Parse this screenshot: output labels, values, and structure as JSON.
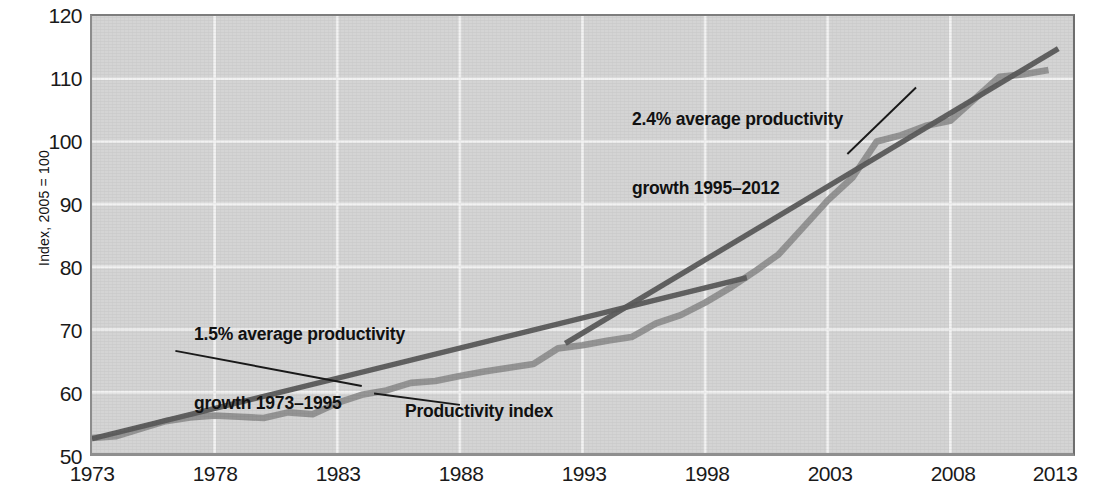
{
  "colors": {
    "plot_background": "#d4d4d4",
    "gridline": "#f2f2f2",
    "series_line": "#8d8d8d",
    "trend_line": "#5b5b5b",
    "text": "#111111"
  },
  "axes": {
    "y_title": "Index, 2005 = 100",
    "y_ticks": [
      "120",
      "110",
      "100",
      "90",
      "80",
      "70",
      "60",
      "50"
    ],
    "x_ticks": [
      "1973",
      "1978",
      "1983",
      "1988",
      "1993",
      "1998",
      "2003",
      "2008",
      "2013"
    ]
  },
  "annotations": {
    "trend1_line1": "1.5% average productivity",
    "trend1_line2": "growth 1973–1995",
    "trend2_line1": "2.4% average productivity",
    "trend2_line2": "growth 1995–2012",
    "series_label": "Productivity index"
  },
  "chart_data": {
    "type": "line",
    "title": "",
    "xlabel": "",
    "ylabel": "Index, 2005 = 100",
    "xlim": [
      1973,
      2013
    ],
    "ylim": [
      50,
      120
    ],
    "grid": true,
    "legend": "none",
    "x_tick_values": [
      1973,
      1978,
      1983,
      1988,
      1993,
      1998,
      2003,
      2008,
      2013
    ],
    "y_tick_values": [
      50,
      60,
      70,
      80,
      90,
      100,
      110,
      120
    ],
    "series": [
      {
        "name": "Productivity index",
        "color": "#8d8d8d",
        "x": [
          1973,
          1974,
          1975,
          1976,
          1977,
          1978,
          1979,
          1980,
          1981,
          1982,
          1983,
          1984,
          1985,
          1986,
          1987,
          1988,
          1989,
          1990,
          1991,
          1992,
          1993,
          1994,
          1995,
          1996,
          1997,
          1998,
          1999,
          2000,
          2001,
          2002,
          2003,
          2004,
          2005,
          2006,
          2007,
          2008,
          2009,
          2010,
          2011,
          2012
        ],
        "y": [
          52.7,
          53.0,
          54.2,
          55.4,
          56.0,
          56.3,
          56.1,
          55.9,
          56.8,
          56.5,
          58.3,
          59.6,
          60.3,
          61.5,
          61.8,
          62.6,
          63.3,
          63.9,
          64.5,
          67.0,
          67.5,
          68.2,
          68.8,
          71.0,
          72.3,
          74.3,
          76.6,
          79.2,
          82.0,
          86.3,
          90.6,
          94.2,
          100.0,
          101.0,
          102.5,
          103.3,
          106.8,
          110.3,
          110.7,
          111.4
        ]
      },
      {
        "name": "1.5% average productivity growth 1973–1995 trend",
        "color": "#5b5b5b",
        "type": "trend",
        "x": [
          1973,
          1999.7
        ],
        "y": [
          52.6,
          78.3
        ],
        "annual_growth_percent": 1.5,
        "fit_period": [
          1973,
          1995
        ]
      },
      {
        "name": "2.4% average productivity growth 1995–2012 trend",
        "color": "#5b5b5b",
        "type": "trend",
        "x": [
          1992.3,
          2012.4
        ],
        "y": [
          67.8,
          114.8
        ],
        "annual_growth_percent": 2.4,
        "fit_period": [
          1995,
          2012
        ]
      }
    ],
    "annotations": [
      {
        "text": "1.5% average productivity growth 1973–1995",
        "anchor_x": 1984.0,
        "anchor_y": 61.0
      },
      {
        "text": "2.4% average productivity growth 1995–2012",
        "anchor_x": 2003.8,
        "anchor_y": 98.0
      },
      {
        "text": "Productivity index",
        "anchor_x": 1984.5,
        "anchor_y": 59.8
      }
    ]
  }
}
